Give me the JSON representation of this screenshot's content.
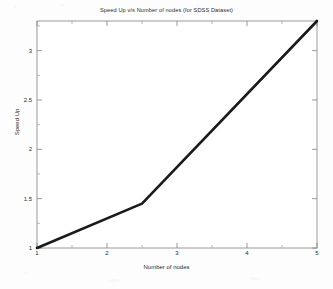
{
  "chart_data": {
    "type": "line",
    "title": "Speed Up v/s Number of nodes (for SDSS Dataset)",
    "xlabel": "Number of nodes",
    "ylabel": "Speed Up",
    "xlim": [
      1,
      5
    ],
    "ylim": [
      1,
      3.3
    ],
    "grid": false,
    "legend": null,
    "xticks": [
      1,
      2,
      3,
      4,
      5
    ],
    "xtick_labels": [
      "1",
      "2",
      "3",
      "4",
      "5"
    ],
    "xminor_ticks": [
      1.5,
      2.5,
      3.5,
      4.5
    ],
    "yticks": [
      1,
      1.5,
      2,
      2.5,
      3
    ],
    "ytick_labels": [
      "1",
      "1.5",
      "2",
      "2.5",
      "3"
    ],
    "series": [
      {
        "name": "Speed Up",
        "color": "#1a1a1a",
        "linewidth": 2.6,
        "x": [
          1,
          2.5,
          5
        ],
        "y": [
          1,
          1.45,
          3.3
        ]
      }
    ]
  },
  "axes": {
    "frame_color": "#9a9a9a",
    "background": "#ffffff"
  }
}
